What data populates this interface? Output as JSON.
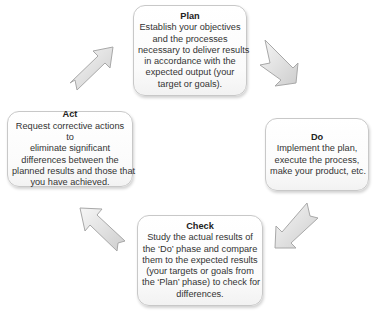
{
  "diagram": {
    "type": "PDCA cycle",
    "steps": {
      "plan": {
        "title": "Plan",
        "lines": [
          "Establish your objectives",
          "and the processes",
          "necessary to deliver results",
          "in accordance with the",
          "expected output (your",
          "target or goals)."
        ]
      },
      "do": {
        "title": "Do",
        "lines": [
          "Implement the plan,",
          "execute the process,",
          "make your product, etc."
        ]
      },
      "check": {
        "title": "Check",
        "lines": [
          "Study the actual results of",
          "the ‘Do’ phase and compare",
          "them to the expected results",
          "(your targets or goals from",
          "the ‘Plan’ phase) to check for",
          "differences."
        ]
      },
      "act": {
        "title": "Act",
        "lines": [
          "Request corrective actions to",
          "eliminate significant",
          "differences between the",
          "planned results and those that",
          "you have achieved."
        ]
      }
    },
    "arrows": [
      {
        "from": "act",
        "to": "plan",
        "direction": "up-right"
      },
      {
        "from": "plan",
        "to": "do",
        "direction": "down-right"
      },
      {
        "from": "do",
        "to": "check",
        "direction": "down-left"
      },
      {
        "from": "check",
        "to": "act",
        "direction": "up-left"
      }
    ],
    "colors": {
      "box_border": "#c8c8c8",
      "arrow_fill_light": "#f4f4f4",
      "arrow_fill_dark": "#cfcfcf",
      "arrow_stroke": "#a8a8a8",
      "text": "#333333"
    }
  }
}
